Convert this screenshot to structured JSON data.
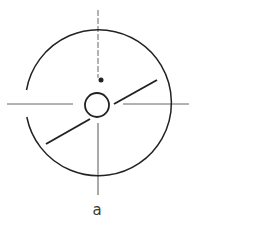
{
  "figure": {
    "label": "a",
    "colors": {
      "stroke": "#222222",
      "axis": "#555555",
      "background": "#ffffff"
    },
    "outer_circle": {
      "cx": 98,
      "cy": 104,
      "r": 73,
      "gap": "left side, between y=90 and y=117"
    },
    "inner_circle": {
      "cx": 97,
      "cy": 105,
      "r": 12
    },
    "dot": {
      "cx": 101,
      "cy": 80,
      "r": 2.5
    },
    "vertical_axis": {
      "x": 98,
      "y1": 10,
      "y2": 195,
      "style": "dashed above center"
    },
    "horizontal_axis": {
      "y": 104,
      "left": [
        7,
        73
      ],
      "right": [
        123,
        189
      ]
    },
    "diagonal_segments": [
      {
        "x1": 46,
        "y1": 144,
        "x2": 90,
        "y2": 119
      },
      {
        "x1": 114,
        "y1": 104,
        "x2": 157,
        "y2": 80
      }
    ]
  }
}
